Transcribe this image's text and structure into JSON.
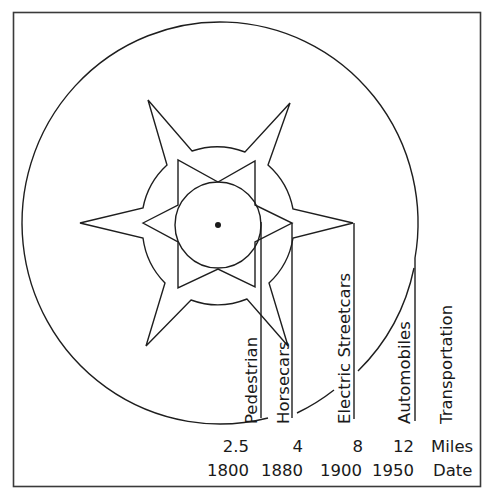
{
  "diagram": {
    "colors": {
      "line": "#1e1e1e",
      "background": "#ffffff",
      "frame": "#3a3a3a"
    },
    "eras": [
      {
        "label": "Pedestrian",
        "miles": "2.5",
        "date": "1800"
      },
      {
        "label": "Horsecars",
        "miles": "4",
        "date": "1880"
      },
      {
        "label": "Electric Streetcars",
        "miles": "8",
        "date": "1900"
      },
      {
        "label": "Automobiles",
        "miles": "12",
        "date": "1950"
      }
    ],
    "header_label": "Transportation",
    "miles_label": "Miles",
    "date_label": "Date"
  }
}
